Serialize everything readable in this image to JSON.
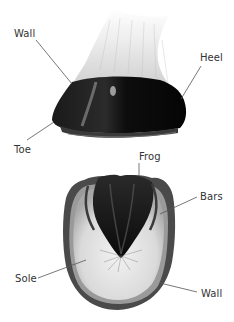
{
  "diagram": {
    "upper_view": {
      "name": "side view of hoof",
      "labels": [
        {
          "id": "wall-top",
          "text": "Wall",
          "x": 14,
          "y": 28
        },
        {
          "id": "heel",
          "text": "Heel",
          "x": 200,
          "y": 52
        },
        {
          "id": "toe",
          "text": "Toe",
          "x": 14,
          "y": 144
        }
      ]
    },
    "lower_view": {
      "name": "underside view of hoof",
      "labels": [
        {
          "id": "frog",
          "text": "Frog",
          "x": 139,
          "y": 151
        },
        {
          "id": "bars",
          "text": "Bars",
          "x": 200,
          "y": 191
        },
        {
          "id": "sole",
          "text": "Sole",
          "x": 15,
          "y": 273
        },
        {
          "id": "wall-bottom",
          "text": "Wall",
          "x": 201,
          "y": 288
        }
      ]
    },
    "colors": {
      "background": "#ffffff",
      "label_text": "#333333",
      "leader_line": "#555555",
      "hoof_dark": "#111111",
      "hair_light": "#e8e8e8",
      "sole_light": "#dcdcdc"
    }
  }
}
